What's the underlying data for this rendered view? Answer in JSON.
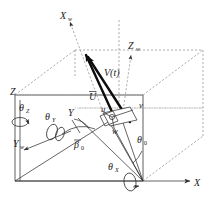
{
  "figure": {
    "type": "technical-line-diagram",
    "background_color": "#ffffff",
    "line_color": "#4d4d4d",
    "dash_color": "#8c8c8c",
    "vector_color": "#0d0d0d",
    "width_px": 217,
    "height_px": 198
  },
  "axes": {
    "global": [
      {
        "id": "Z",
        "label": "Z",
        "subscript": "",
        "x": 14,
        "y": 92
      },
      {
        "id": "X",
        "label": "X",
        "subscript": "",
        "x": 198,
        "y": 184
      },
      {
        "id": "Y",
        "label": "Y",
        "subscript": "",
        "x": 72,
        "y": 113
      }
    ],
    "wind": [
      {
        "id": "Xw",
        "label": "X",
        "subscript": "w",
        "x": 62,
        "y": 16
      },
      {
        "id": "Zw",
        "label": "Z",
        "subscript": "w",
        "x": 131,
        "y": 46
      },
      {
        "id": "Yw",
        "label": "Y",
        "subscript": "w",
        "x": 20,
        "y": 143
      }
    ]
  },
  "vectors": {
    "velocity": {
      "label": "V(t)",
      "x": 112,
      "y": 72
    },
    "mean_flow": {
      "label": "U",
      "overbar": true,
      "display": "Ū",
      "x": 93,
      "y": 97
    },
    "components": [
      {
        "id": "u",
        "label": "u",
        "x": 104,
        "y": 110
      },
      {
        "id": "v",
        "label": "v",
        "x": 141,
        "y": 107
      },
      {
        "id": "w",
        "label": "w",
        "x": 115,
        "y": 130
      }
    ]
  },
  "angles": {
    "euler": [
      {
        "id": "theta-Z",
        "label": "θ",
        "subscript": "Z",
        "x": 22,
        "y": 108
      },
      {
        "id": "theta-Y",
        "label": "θ",
        "subscript": "Y",
        "x": 50,
        "y": 117
      },
      {
        "id": "theta-X",
        "label": "θ",
        "subscript": "X",
        "x": 112,
        "y": 167
      }
    ],
    "flow": [
      {
        "id": "beta-0",
        "label": "β",
        "subscript": "0",
        "x": 78,
        "y": 145
      },
      {
        "id": "theta-0",
        "label": "θ",
        "subscript": "0",
        "x": 140,
        "y": 140
      }
    ]
  },
  "box": {
    "front_face": {
      "x1": 15,
      "y1": 95,
      "x2": 143,
      "y2": 181
    },
    "depth_offset": {
      "dx": 60,
      "dy": -45
    }
  }
}
